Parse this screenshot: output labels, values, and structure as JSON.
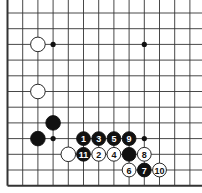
{
  "diagram": {
    "type": "go-board-corner",
    "visible_edges": [
      "left",
      "bottom"
    ],
    "columns": 13,
    "rows": 12,
    "grid": {
      "x0": 7.5,
      "dx": 15.2,
      "y0": 13,
      "dy": 15.7
    },
    "colors": {
      "line": "#333333",
      "black": "#111111",
      "white": "#ffffff",
      "background": "#ffffff"
    },
    "star_points": [
      {
        "col": 3,
        "row": 2
      },
      {
        "col": 9,
        "row": 2
      },
      {
        "col": 3,
        "row": 8
      },
      {
        "col": 9,
        "row": 8
      }
    ],
    "stones": [
      {
        "color": "white",
        "col": 2,
        "row": 2,
        "label": ""
      },
      {
        "color": "white",
        "col": 2,
        "row": 5,
        "label": ""
      },
      {
        "color": "black",
        "col": 3,
        "row": 7,
        "label": ""
      },
      {
        "color": "black",
        "col": 2,
        "row": 8,
        "label": ""
      },
      {
        "color": "white",
        "col": 4,
        "row": 9,
        "label": ""
      },
      {
        "color": "black",
        "col": 5,
        "row": 8,
        "label": "1"
      },
      {
        "color": "white",
        "col": 6,
        "row": 9,
        "label": "2"
      },
      {
        "color": "black",
        "col": 6,
        "row": 8,
        "label": "3"
      },
      {
        "color": "white",
        "col": 7,
        "row": 9,
        "label": "4"
      },
      {
        "color": "black",
        "col": 7,
        "row": 8,
        "label": "5"
      },
      {
        "color": "white",
        "col": 8,
        "row": 10,
        "label": "6"
      },
      {
        "color": "black",
        "col": 9,
        "row": 10,
        "label": "7"
      },
      {
        "color": "white",
        "col": 9,
        "row": 9,
        "label": "8"
      },
      {
        "color": "black",
        "col": 8,
        "row": 8,
        "label": "9"
      },
      {
        "color": "white",
        "col": 10,
        "row": 10,
        "label": "10"
      },
      {
        "color": "black",
        "col": 5,
        "row": 9,
        "label": "11"
      },
      {
        "color": "black",
        "col": 8,
        "row": 9,
        "label": ""
      }
    ]
  }
}
